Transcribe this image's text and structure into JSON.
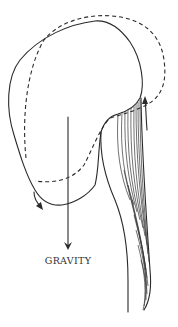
{
  "diagram": {
    "labels": {
      "gravity": "GRAVITY"
    },
    "elements": {
      "head_outline_solid": "head position (forward, flexed)",
      "head_outline_dashed": "head position (upright)",
      "gravity_arrow": "downward arrow indicating gravity",
      "rotation_arrow_front": "curved arrow at chin showing downward rotation",
      "rotation_arrow_back": "curved arrow at back of neck showing upward pull",
      "neck_muscles": "hatched posterior neck muscles"
    },
    "colors": {
      "line": "#2a2a2a",
      "background": "#ffffff"
    }
  }
}
